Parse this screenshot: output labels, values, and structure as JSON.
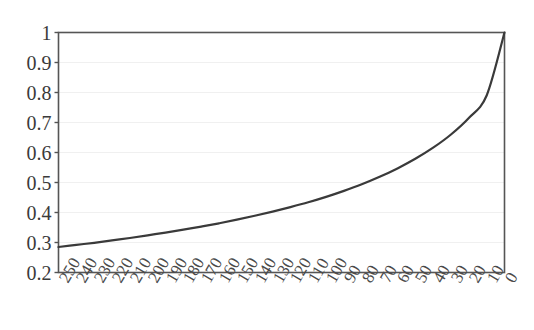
{
  "chart_data": {
    "type": "line",
    "title": "",
    "subtitle": "",
    "xlabel": "",
    "ylabel": "",
    "xlim": [
      250,
      0
    ],
    "ylim": [
      0.2,
      1.0
    ],
    "x_axis_reversed": true,
    "grid": true,
    "grid_axis": "y",
    "grid_color": "#f0f0f0",
    "legend": null,
    "legend_position": "none",
    "line_color": "#3a3a3a",
    "line_width": 2.2,
    "background_color": "#ffffff",
    "frame_color": "#555555",
    "x_tick_labels": [
      "250",
      "240",
      "230",
      "220",
      "210",
      "200",
      "190",
      "180",
      "170",
      "160",
      "150",
      "140",
      "130",
      "120",
      "110",
      "100",
      "90",
      "80",
      "70",
      "60",
      "50",
      "40",
      "30",
      "20",
      "10",
      "0"
    ],
    "x_tick_values": [
      250,
      240,
      230,
      220,
      210,
      200,
      190,
      180,
      170,
      160,
      150,
      140,
      130,
      120,
      110,
      100,
      90,
      80,
      70,
      60,
      50,
      40,
      30,
      20,
      10,
      0
    ],
    "x_tick_rotation_deg": -60,
    "y_tick_labels": [
      "1",
      "0.9",
      "0.8",
      "0.7",
      "0.6",
      "0.5",
      "0.4",
      "0.3",
      "0.2"
    ],
    "y_tick_values": [
      1.0,
      0.9,
      0.8,
      0.7,
      0.6,
      0.5,
      0.4,
      0.3,
      0.2
    ],
    "x": [
      250,
      240,
      230,
      220,
      210,
      200,
      190,
      180,
      170,
      160,
      150,
      140,
      130,
      120,
      110,
      100,
      90,
      80,
      70,
      60,
      50,
      40,
      30,
      20,
      10,
      0
    ],
    "values": [
      0.285,
      0.292,
      0.299,
      0.307,
      0.315,
      0.324,
      0.333,
      0.343,
      0.353,
      0.364,
      0.376,
      0.389,
      0.403,
      0.418,
      0.434,
      0.452,
      0.472,
      0.494,
      0.519,
      0.547,
      0.579,
      0.616,
      0.66,
      0.715,
      0.79,
      1.0
    ],
    "series": [
      {
        "name": "curve",
        "values": [
          0.285,
          0.292,
          0.299,
          0.307,
          0.315,
          0.324,
          0.333,
          0.343,
          0.353,
          0.364,
          0.376,
          0.389,
          0.403,
          0.418,
          0.434,
          0.452,
          0.472,
          0.494,
          0.519,
          0.547,
          0.579,
          0.616,
          0.66,
          0.715,
          0.79,
          1.0
        ]
      }
    ],
    "annotations": []
  }
}
